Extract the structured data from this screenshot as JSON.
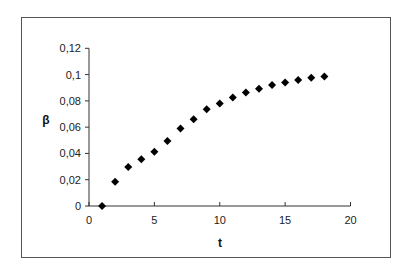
{
  "chart_data": {
    "type": "scatter",
    "title": "",
    "xlabel": "t",
    "ylabel": "β",
    "xlim": [
      0,
      20
    ],
    "ylim": [
      0,
      0.12
    ],
    "x_ticks": [
      0,
      5,
      10,
      15,
      20
    ],
    "x_tick_labels": [
      "0",
      "5",
      "10",
      "15",
      "20"
    ],
    "y_ticks": [
      0,
      0.02,
      0.04,
      0.06,
      0.08,
      0.1,
      0.12
    ],
    "y_tick_labels": [
      "0",
      "0,02",
      "0,04",
      "0,06",
      "0,08",
      "0,1",
      "0,12"
    ],
    "grid": false,
    "legend": null,
    "marker": "diamond",
    "marker_color": "#000000",
    "series": [
      {
        "name": "β",
        "x": [
          1,
          2,
          3,
          4,
          5,
          6,
          7,
          8,
          9,
          10,
          11,
          12,
          13,
          14,
          15,
          16,
          17,
          18
        ],
        "values": [
          0.0,
          0.0185,
          0.0296,
          0.0355,
          0.0413,
          0.0494,
          0.059,
          0.066,
          0.0737,
          0.078,
          0.0826,
          0.0864,
          0.0892,
          0.092,
          0.094,
          0.0958,
          0.0975,
          0.0986
        ]
      }
    ]
  }
}
